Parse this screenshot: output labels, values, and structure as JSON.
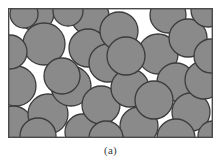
{
  "figure": {
    "caption": "(a)",
    "panel_label": "(a)",
    "colors": {
      "grain_fill": "#8a8a8a",
      "grain_stroke": "#3c3c3c",
      "matrix_background": "#ffffff",
      "frame_stroke": "#4a4a4a",
      "caption_text": "#3a3a3a"
    },
    "frame": {
      "x": 0,
      "y": 0,
      "width": 205,
      "height": 130,
      "stroke_width": 1.4
    },
    "grain_radius_nominal": 17,
    "grain_count": 39,
    "grains": [
      {
        "cx": 28,
        "cy": 5,
        "r": 18
      },
      {
        "cx": 36,
        "cy": 36,
        "r": 21
      },
      {
        "cx": 8,
        "cy": 78,
        "r": 20
      },
      {
        "cx": 5,
        "cy": 118,
        "r": 20
      },
      {
        "cx": 2,
        "cy": 44,
        "r": 17
      },
      {
        "cx": 40,
        "cy": 106,
        "r": 20
      },
      {
        "cx": 63,
        "cy": 78,
        "r": 20
      },
      {
        "cx": 54,
        "cy": 68,
        "r": 18
      },
      {
        "cx": 30,
        "cy": 128,
        "r": 18
      },
      {
        "cx": 75,
        "cy": 124,
        "r": 18
      },
      {
        "cx": 82,
        "cy": 8,
        "r": 19
      },
      {
        "cx": 80,
        "cy": 40,
        "r": 19
      },
      {
        "cx": 100,
        "cy": 55,
        "r": 19
      },
      {
        "cx": 111,
        "cy": 23,
        "r": 19
      },
      {
        "cx": 93,
        "cy": 97,
        "r": 19
      },
      {
        "cx": 122,
        "cy": 80,
        "r": 19
      },
      {
        "cx": 131,
        "cy": 118,
        "r": 19
      },
      {
        "cx": 160,
        "cy": 7,
        "r": 18
      },
      {
        "cx": 150,
        "cy": 46,
        "r": 20
      },
      {
        "cx": 180,
        "cy": 30,
        "r": 19
      },
      {
        "cx": 168,
        "cy": 74,
        "r": 19
      },
      {
        "cx": 146,
        "cy": 92,
        "r": 19
      },
      {
        "cx": 118,
        "cy": 48,
        "r": 19
      },
      {
        "cx": 183,
        "cy": 104,
        "r": 19
      },
      {
        "cx": 196,
        "cy": 72,
        "r": 19
      },
      {
        "cx": 200,
        "cy": 2,
        "r": 17
      },
      {
        "cx": 203,
        "cy": 48,
        "r": 17
      },
      {
        "cx": 168,
        "cy": 130,
        "r": 19
      },
      {
        "cx": 205,
        "cy": 128,
        "r": 15
      },
      {
        "cx": 98,
        "cy": 130,
        "r": 17
      },
      {
        "cx": 60,
        "cy": 3,
        "r": 15
      },
      {
        "cx": 16,
        "cy": 6,
        "r": 14
      }
    ]
  }
}
